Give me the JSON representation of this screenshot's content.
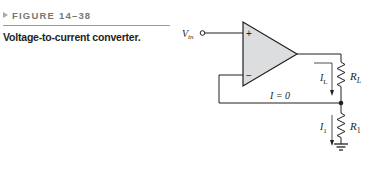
{
  "figure": {
    "number_label": "FIGURE 14–38",
    "title": "Voltage-to-current converter."
  },
  "circuit": {
    "input_label": "V",
    "input_label_sub": "in",
    "opamp_plus": "+",
    "opamp_minus": "−",
    "load_resistor_label": "R",
    "load_resistor_sub": "L",
    "load_current_label": "I",
    "load_current_sub": "L",
    "feedback_current_label": "I = 0",
    "resistor1_label": "R",
    "resistor1_sub": "1",
    "resistor1_current_label": "I",
    "resistor1_current_sub": "1",
    "opamp_fill": "#dcdddf",
    "line_color": "#231f20"
  }
}
